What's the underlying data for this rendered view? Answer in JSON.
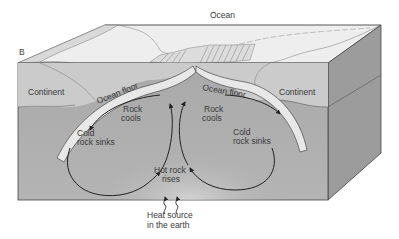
{
  "diagram": {
    "title": "Ocean",
    "panel_label": "B",
    "labels": {
      "continent_left": "Continent",
      "continent_right": "Continent",
      "ocean_floor_left": "Ocean floor",
      "ocean_floor_right": "Ocean floor",
      "rock_cools_left_1": "Rock",
      "rock_cools_left_2": "cools",
      "rock_cools_right_1": "Rock",
      "rock_cools_right_2": "cools",
      "cold_sinks_left_1": "Cold",
      "cold_sinks_left_2": "rock sinks",
      "cold_sinks_right_1": "Cold",
      "cold_sinks_right_2": "rock sinks",
      "hot_rises_1": "Hot rock",
      "hot_rises_2": "rises",
      "heat_source_1": "Heat source",
      "heat_source_2": "in the earth"
    },
    "colors": {
      "top_surface": "#ececec",
      "front_crust": "#c9c9c9",
      "front_mantle": "#a8a8a8",
      "side_face": "#9a9a9a",
      "ocean_floor_band": "#e6e6e6",
      "lines": "#333333"
    }
  }
}
